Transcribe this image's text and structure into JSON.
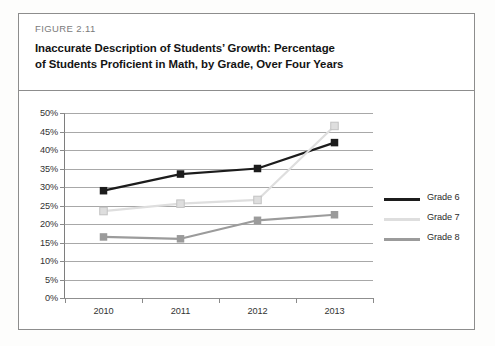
{
  "figure": {
    "number_label": "FIGURE 2.11",
    "title_line_1": "Inaccurate Description of Students’ Growth: Percentage",
    "title_line_2": "of Students Proficient in Math, by Grade, Over Four Years"
  },
  "colors": {
    "grade_6": "#1c1c1c",
    "grade_7": "#dedede",
    "grade_8": "#9b9b9b",
    "gridline": "#a8a8a8",
    "frame": "#8d8d8d",
    "text": "#333333"
  },
  "chart_data": {
    "type": "line",
    "title": "Inaccurate Description of Students’ Growth: Percentage of Students Proficient in Math, by Grade, Over Four Years",
    "xlabel": "",
    "ylabel": "",
    "categories": [
      "2010",
      "2011",
      "2012",
      "2013"
    ],
    "ylim": [
      0,
      50
    ],
    "ytick_labels": [
      "0%",
      "5%",
      "10%",
      "15%",
      "20%",
      "25%",
      "30%",
      "35%",
      "40%",
      "45%",
      "50%"
    ],
    "ytick_values": [
      0,
      5,
      10,
      15,
      20,
      25,
      30,
      35,
      40,
      45,
      50
    ],
    "grid": true,
    "legend_position": "right",
    "markers": "square",
    "series": [
      {
        "name": "Grade 6",
        "color": "#1c1c1c",
        "values": [
          29,
          33.5,
          35,
          42
        ]
      },
      {
        "name": "Grade 7",
        "color": "#dedede",
        "values": [
          23.5,
          25.5,
          26.5,
          46.5
        ]
      },
      {
        "name": "Grade 8",
        "color": "#9b9b9b",
        "values": [
          16.5,
          16,
          21,
          22.5
        ]
      }
    ]
  }
}
